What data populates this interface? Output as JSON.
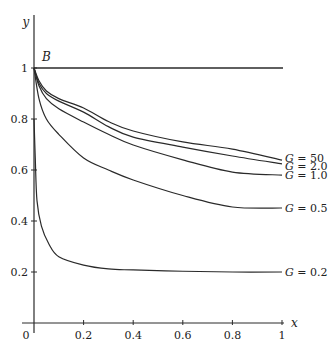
{
  "chart_data": {
    "type": "line",
    "title": "",
    "xlabel": "x",
    "ylabel": "y",
    "xlim": [
      0,
      1
    ],
    "ylim": [
      0,
      1
    ],
    "grid": false,
    "legend_position": "inline-right",
    "x_ticks": [
      0,
      0.2,
      0.4,
      0.6,
      0.8,
      1
    ],
    "x_tick_labels": [
      "0",
      "0.2",
      "0.4",
      "0.6",
      "0.8",
      "1"
    ],
    "y_ticks": [
      0.2,
      0.4,
      0.6,
      0.8,
      1
    ],
    "y_tick_labels": [
      "0.2",
      "0.4",
      "0.6",
      "0.8",
      "1"
    ],
    "annotations": [
      {
        "text": "B",
        "x": 0.02,
        "y": 1.04
      }
    ],
    "reference_line": {
      "y": 1,
      "x": [
        0,
        1
      ]
    },
    "series": [
      {
        "name": "G = 50",
        "x": [
          0,
          0.02,
          0.05,
          0.1,
          0.2,
          0.3,
          0.4,
          0.6,
          0.8,
          1.0
        ],
        "values": [
          1.0,
          0.95,
          0.91,
          0.88,
          0.843,
          0.79,
          0.753,
          0.71,
          0.682,
          0.639
        ]
      },
      {
        "name": "G = 2.0",
        "x": [
          0,
          0.02,
          0.05,
          0.1,
          0.2,
          0.3,
          0.4,
          0.6,
          0.8,
          1.0
        ],
        "values": [
          1.0,
          0.94,
          0.9,
          0.87,
          0.827,
          0.77,
          0.729,
          0.69,
          0.655,
          0.624
        ]
      },
      {
        "name": "G = 1.0",
        "x": [
          0,
          0.02,
          0.05,
          0.1,
          0.2,
          0.3,
          0.4,
          0.6,
          0.8,
          1.0
        ],
        "values": [
          1.0,
          0.93,
          0.88,
          0.84,
          0.788,
          0.74,
          0.698,
          0.64,
          0.592,
          0.58
        ]
      },
      {
        "name": "G = 0.5",
        "x": [
          0,
          0.02,
          0.05,
          0.1,
          0.2,
          0.3,
          0.4,
          0.6,
          0.8,
          1.0
        ],
        "values": [
          1.0,
          0.88,
          0.8,
          0.74,
          0.647,
          0.6,
          0.561,
          0.5,
          0.455,
          0.451
        ]
      },
      {
        "name": "G = 0.2",
        "x": [
          0,
          0.005,
          0.012,
          0.03,
          0.06,
          0.1,
          0.2,
          0.3,
          0.4,
          0.6,
          0.8,
          1.0
        ],
        "values": [
          0.8,
          0.65,
          0.48,
          0.38,
          0.31,
          0.26,
          0.227,
          0.212,
          0.208,
          0.203,
          0.2,
          0.2
        ]
      }
    ]
  },
  "labels": {
    "y_axis": "y",
    "x_axis": "x",
    "origin": "0",
    "point_b": "B",
    "series_g": "G",
    "series_values": [
      "= 50",
      "= 2.0",
      "= 1.0",
      "= 0.5",
      "= 0.2"
    ]
  }
}
